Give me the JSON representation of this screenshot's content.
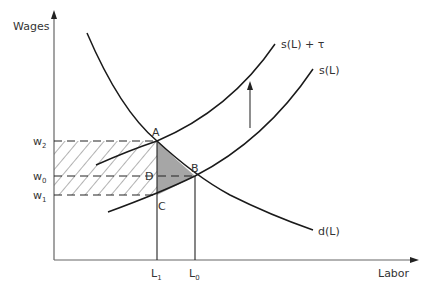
{
  "figure": {
    "type": "supply-demand-tax-incidence",
    "axes": {
      "y_label": "Wages",
      "x_label": "Labor"
    },
    "curves": {
      "demand": "d(L)",
      "supply": "s(L)",
      "supply_taxed": "s(L) + τ"
    },
    "points": {
      "A": "A",
      "B": "B",
      "C": "C",
      "D": "D"
    },
    "wage_levels": {
      "w2": {
        "base": "w",
        "sub": "2"
      },
      "w0": {
        "base": "w",
        "sub": "0"
      },
      "w1": {
        "base": "w",
        "sub": "1"
      }
    },
    "labor_levels": {
      "L1": {
        "base": "L",
        "sub": "1"
      },
      "L0": {
        "base": "L",
        "sub": "0"
      }
    },
    "regions": {
      "hatched": "tax revenue rectangle (w1 to w2, 0 to L1)",
      "shaded": "deadweight loss triangle ABC"
    },
    "colors": {
      "line": "#1a1a1a",
      "axis": "#555555",
      "shade": "#a6a6a6",
      "hatch": "#555555"
    }
  }
}
